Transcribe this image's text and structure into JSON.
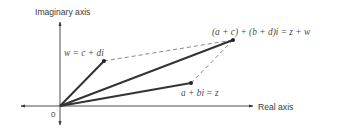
{
  "diagram": {
    "colors": {
      "axis": "#3a3a3a",
      "vector": "#333333",
      "dashed": "#6a6a6a",
      "text": "#3a3a3a"
    },
    "axes": {
      "vertical_label": "Imaginary axis",
      "horizontal_label": "Real axis",
      "origin_label": "0"
    },
    "points": {
      "w": {
        "label": "w = c + di"
      },
      "z": {
        "label": "a + bi = z"
      },
      "sum": {
        "label": "(a + c) + (b + d)i = z + w"
      }
    }
  }
}
